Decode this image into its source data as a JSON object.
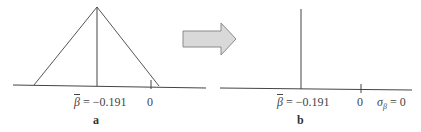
{
  "panel_a": {
    "label": "a",
    "mean_symbol": "β",
    "mean_text": " = −0.191",
    "zero_label": "0"
  },
  "panel_b": {
    "label": "b",
    "mean_symbol": "β",
    "mean_text": " = −0.191",
    "zero_label": "0",
    "sigma_symbol": "σ",
    "sigma_sub": "β",
    "sigma_text": " = 0"
  },
  "arrow": {
    "fill": "#d9d9d9",
    "stroke": "#8a8a8a",
    "direction": "right"
  },
  "colors": {
    "line": "#444444"
  }
}
